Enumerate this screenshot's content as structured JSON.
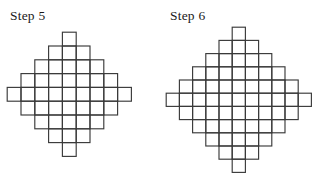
{
  "page": {
    "background_color": "#ffffff",
    "stroke_color": "#3a3a3a",
    "text_color": "#1a1a1a"
  },
  "figures": [
    {
      "id": "step-5",
      "label": "Step 5",
      "shape": "diamond",
      "step_number": 5,
      "row_widths": [
        1,
        3,
        5,
        7,
        9,
        7,
        5,
        3,
        1
      ],
      "row_count": 9,
      "max_row_width": 9,
      "square_count": 41,
      "cell_size": 13.8,
      "origin_x": 6,
      "origin_y": 31
    },
    {
      "id": "step-6",
      "label": "Step 6",
      "shape": "diamond",
      "step_number": 6,
      "row_widths": [
        1,
        3,
        5,
        7,
        9,
        11,
        9,
        7,
        5,
        3,
        1
      ],
      "row_count": 11,
      "max_row_width": 11,
      "square_count": 61,
      "cell_size": 13.2,
      "origin_x": 4,
      "origin_y": 26
    }
  ]
}
